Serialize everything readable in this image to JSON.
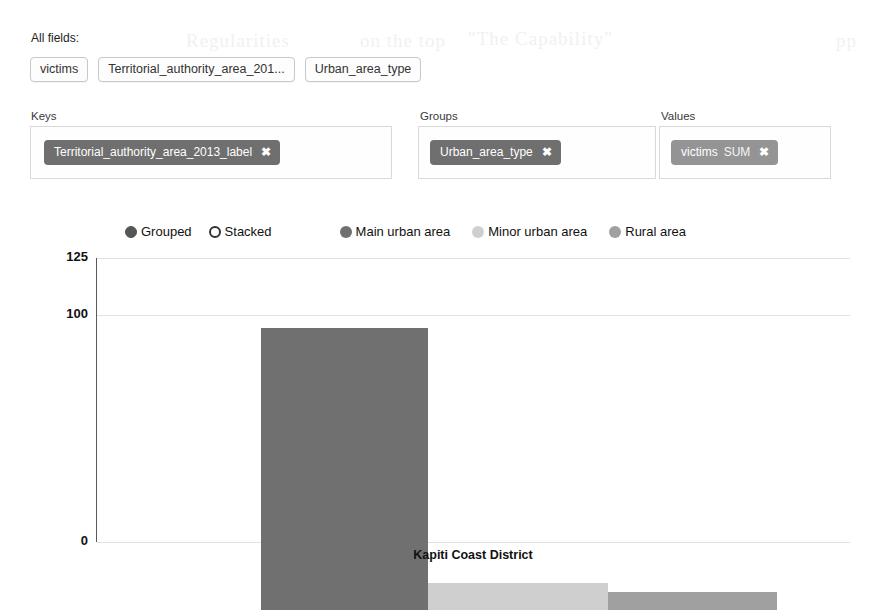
{
  "all_fields": {
    "label": "All fields:",
    "chips": [
      {
        "name": "victims"
      },
      {
        "name": "Territorial_authority_area_201..."
      },
      {
        "name": "Urban_area_type"
      }
    ]
  },
  "shelves": {
    "keys": {
      "label": "Keys",
      "pill": {
        "field": "Territorial_authority_area_2013_label",
        "agg": "",
        "remove": "✖"
      }
    },
    "groups": {
      "label": "Groups",
      "pill": {
        "field": "Urban_area_type",
        "agg": "",
        "remove": "✖"
      }
    },
    "values": {
      "label": "Values",
      "pill": {
        "field": "victims",
        "agg": "SUM",
        "remove": "✖"
      }
    }
  },
  "chart_mode": {
    "options": [
      {
        "label": "Grouped",
        "selected": true
      },
      {
        "label": "Stacked",
        "selected": false
      }
    ]
  },
  "legend": {
    "entries": [
      {
        "label": "Main urban area",
        "color": "#707070"
      },
      {
        "label": "Minor urban area",
        "color": "#cfcfcf"
      },
      {
        "label": "Rural area",
        "color": "#a0a0a0"
      }
    ]
  },
  "chart_data": {
    "type": "bar",
    "title": "",
    "xlabel": "Kapiti Coast District",
    "ylabel": "",
    "categories": [
      "Kapiti Coast District"
    ],
    "grid": true,
    "legend_position": "top",
    "ylim": [
      0,
      125
    ],
    "yticks": [
      125,
      100,
      0
    ],
    "ytick_labels": [
      "125",
      "100",
      "0"
    ],
    "series": [
      {
        "name": "Main urban area",
        "values": [
          124
        ],
        "color": "#707070"
      },
      {
        "name": "Minor urban area",
        "values": [
          12
        ],
        "color": "#cfcfcf"
      },
      {
        "name": "Rural area",
        "values": [
          8
        ],
        "color": "#a0a0a0"
      }
    ]
  },
  "bleed_text": {
    "b1": "Regularities",
    "b2": "on the top",
    "b3": "\"The Capability\"",
    "b4": "pp",
    "b5": ""
  }
}
